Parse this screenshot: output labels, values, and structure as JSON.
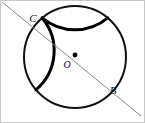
{
  "figure": {
    "kind": "geometry-diagram",
    "canvas": {
      "width": 145,
      "height": 123,
      "background_color": "#ffffff",
      "border_color": "#c8c8c8"
    },
    "colors": {
      "circle_stroke": "#111111",
      "circle_stroke_emphasis": "#000000",
      "line_stroke": "#8a8a8a",
      "label_text": "#111111",
      "center_dot": "#000000"
    },
    "circle": {
      "name": "main-circle",
      "center_x": 75,
      "center_y": 57,
      "radius": 51,
      "stroke_width": 2
    },
    "center_point": {
      "name": "center-O",
      "x": 75,
      "y": 55,
      "radius": 2.4
    },
    "secant_line": {
      "name": "line-CB",
      "x1": 2,
      "y1": 2,
      "x2": 141,
      "y2": 116,
      "stroke_width": 1
    },
    "labels": {
      "point_c": "C",
      "point_o": "O",
      "point_b": "B"
    },
    "label_positions": {
      "point_c": {
        "x": 33,
        "y": 22
      },
      "point_o": {
        "x": 67,
        "y": 68
      },
      "point_b": {
        "x": 113,
        "y": 94
      }
    }
  }
}
